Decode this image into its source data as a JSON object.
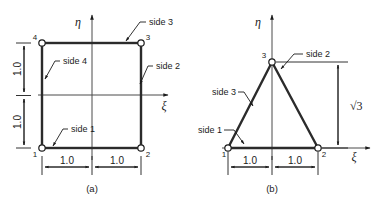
{
  "figure": {
    "caption_a": "(a)",
    "caption_b": "(b)",
    "colors": {
      "ink": "#1b1b1b",
      "element_edge": "#2b2b2b",
      "thin_line": "#4a4a4a",
      "node_fill": "#ffffff",
      "background": "#ffffff"
    }
  },
  "panel_a": {
    "name": "square-master-element",
    "nodes": [
      {
        "id": "1",
        "label": "1",
        "xi": -1.0,
        "eta": -1.0
      },
      {
        "id": "2",
        "label": "2",
        "xi": 1.0,
        "eta": -1.0
      },
      {
        "id": "3",
        "label": "3",
        "xi": 1.0,
        "eta": 1.0
      },
      {
        "id": "4",
        "label": "4",
        "xi": -1.0,
        "eta": 1.0
      }
    ],
    "sides": [
      {
        "id": "side1",
        "label": "side 1"
      },
      {
        "id": "side2",
        "label": "side 2"
      },
      {
        "id": "side3",
        "label": "side 3"
      },
      {
        "id": "side4",
        "label": "side 4"
      }
    ],
    "axes": {
      "horizontal": "ξ",
      "vertical": "η"
    },
    "dimensions": [
      {
        "id": "h-left",
        "label": "1.0",
        "orientation": "horizontal"
      },
      {
        "id": "h-right",
        "label": "1.0",
        "orientation": "horizontal"
      },
      {
        "id": "v-lower",
        "label": "1.0",
        "orientation": "vertical"
      },
      {
        "id": "v-upper",
        "label": "1.0",
        "orientation": "vertical"
      }
    ]
  },
  "panel_b": {
    "name": "triangle-master-element",
    "nodes": [
      {
        "id": "1",
        "label": "1",
        "xi": -1.0,
        "eta": 0.0
      },
      {
        "id": "2",
        "label": "2",
        "xi": 1.0,
        "eta": 0.0
      },
      {
        "id": "3",
        "label": "3",
        "xi": 0.0,
        "eta": 1.732
      }
    ],
    "sides": [
      {
        "id": "side1",
        "label": "side 1"
      },
      {
        "id": "side2",
        "label": "side 2"
      },
      {
        "id": "side3",
        "label": "side 3"
      }
    ],
    "axes": {
      "horizontal": "ξ",
      "vertical": "η"
    },
    "dimensions": [
      {
        "id": "h-left",
        "label": "1.0",
        "orientation": "horizontal"
      },
      {
        "id": "h-right",
        "label": "1.0",
        "orientation": "horizontal"
      },
      {
        "id": "v-height",
        "label": "√3",
        "orientation": "vertical"
      }
    ]
  }
}
